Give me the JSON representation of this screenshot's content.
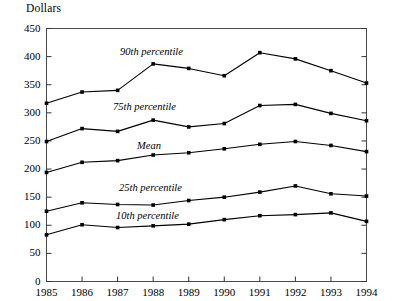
{
  "chart_data": {
    "type": "line",
    "title": "",
    "ylabel": "Dollars",
    "xlabel": "",
    "ylim": [
      0,
      450
    ],
    "ytick_step": 50,
    "yticks": [
      "0",
      "50",
      "100",
      "150",
      "200",
      "250",
      "300",
      "350",
      "400",
      "450"
    ],
    "grid": false,
    "legend_position": "inline-annotations",
    "marker": "square",
    "line_color": "#000000",
    "categories": [
      "1985",
      "1986",
      "1987",
      "1988",
      "1989",
      "1990",
      "1991",
      "1992",
      "1993",
      "1994"
    ],
    "series": [
      {
        "name": "90th percentile",
        "values": [
          317,
          337,
          340,
          387,
          379,
          366,
          407,
          396,
          375,
          353
        ]
      },
      {
        "name": "75th percentile",
        "values": [
          249,
          272,
          267,
          287,
          275,
          281,
          313,
          315,
          299,
          286
        ]
      },
      {
        "name": "Mean",
        "values": [
          194,
          212,
          215,
          225,
          229,
          236,
          244,
          249,
          242,
          231
        ]
      },
      {
        "name": "25th percentile",
        "values": [
          125,
          140,
          137,
          136,
          144,
          150,
          159,
          170,
          156,
          152
        ]
      },
      {
        "name": "10th percentile",
        "values": [
          83,
          101,
          96,
          99,
          102,
          110,
          117,
          119,
          122,
          107
        ]
      }
    ],
    "annotations": [
      {
        "text": "90th percentile",
        "x_px": 120,
        "y_px": 46
      },
      {
        "text": "75th percentile",
        "x_px": 113,
        "y_px": 101
      },
      {
        "text": "Mean",
        "x_px": 137,
        "y_px": 140
      },
      {
        "text": "25th percentile",
        "x_px": 119,
        "y_px": 182
      },
      {
        "text": "10th percentile",
        "x_px": 116,
        "y_px": 210
      }
    ]
  }
}
